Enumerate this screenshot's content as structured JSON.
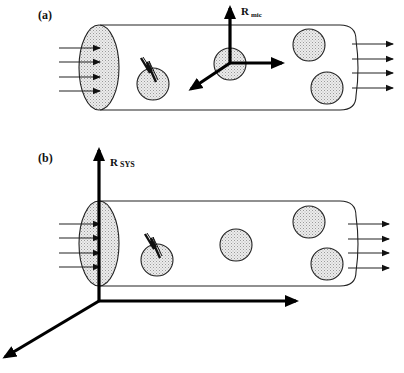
{
  "panels": [
    {
      "id": "a",
      "label": "(a)",
      "frame_label_main": "R",
      "frame_label_sub": "mic",
      "frame_type": "microscopic",
      "particle_count": 4,
      "inflow_arrow_count": 4,
      "outflow_arrow_count": 4
    },
    {
      "id": "b",
      "label": "(b)",
      "frame_label_main": "R",
      "frame_label_sub": "SYS",
      "frame_type": "system",
      "particle_count": 4,
      "inflow_arrow_count": 4,
      "outflow_arrow_count": 4
    }
  ],
  "colors": {
    "line": "#222222",
    "axis": "#000000",
    "particle_fill": "#d8d8d8",
    "background": "#ffffff"
  },
  "icons": {
    "reaction": "lightning-zigzag-icon"
  }
}
